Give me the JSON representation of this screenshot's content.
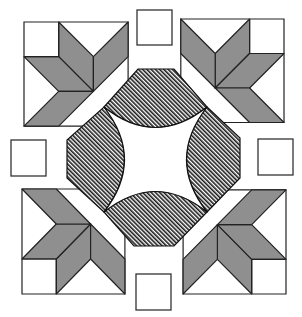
{
  "figure": {
    "colors": {
      "background": "#ffffff",
      "parallelogram_fill": "#8f8f8f",
      "outline": "#222222",
      "hatch_line": "#1a1a1a"
    },
    "corner_blocks": [
      {
        "position": "top-left",
        "x": 24,
        "y": 22,
        "size": 104,
        "orientation": "normal"
      },
      {
        "position": "top-right",
        "x": 181,
        "y": 19,
        "size": 103,
        "orientation": "mirror-x"
      },
      {
        "position": "bottom-left",
        "x": 22,
        "y": 189,
        "size": 103,
        "orientation": "mirror-y"
      },
      {
        "position": "bottom-right",
        "x": 183,
        "y": 190,
        "size": 103,
        "orientation": "rotate-180"
      }
    ],
    "small_squares": [
      {
        "position": "top",
        "x": 137,
        "y": 10,
        "size": 35
      },
      {
        "position": "left",
        "x": 11,
        "y": 140,
        "size": 35
      },
      {
        "position": "right",
        "x": 258,
        "y": 139,
        "size": 35
      },
      {
        "position": "bottom",
        "x": 136,
        "y": 274,
        "size": 35
      }
    ],
    "center_octagon": {
      "points": [
        [
          138,
          69
        ],
        [
          174,
          69
        ],
        [
          240,
          138
        ],
        [
          240,
          178
        ],
        [
          174,
          246
        ],
        [
          134,
          246
        ],
        [
          67,
          178
        ],
        [
          67,
          140
        ]
      ],
      "inner_corners": [
        [
          104,
          107
        ],
        [
          207,
          107
        ],
        [
          207,
          212
        ],
        [
          104,
          212
        ]
      ],
      "fill": "hatched"
    }
  }
}
